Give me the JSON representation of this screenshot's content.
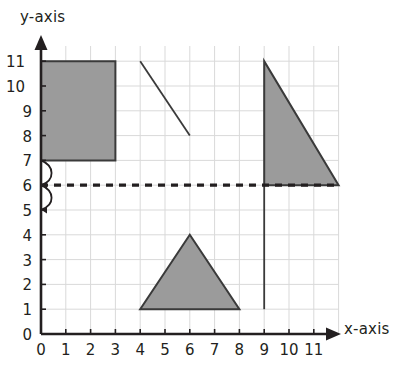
{
  "figure": {
    "kind": "coordinate-grid-diagram",
    "background_color": "#ffffff",
    "grid_color": "#d9d9d9",
    "axis_color": "#231f20",
    "shape_fill_color": "#9b9b9b",
    "shape_stroke_color": "#3a3a3a",
    "dashed_line_color": "#231f20"
  },
  "axes": {
    "x_title": "x-axis",
    "y_title": "y-axis",
    "x_ticks": [
      "0",
      "1",
      "2",
      "3",
      "4",
      "5",
      "6",
      "7",
      "8",
      "9",
      "10",
      "11"
    ],
    "y_ticks": [
      "0",
      "1",
      "2",
      "3",
      "4",
      "5",
      "6",
      "7",
      "8",
      "9",
      "10",
      "11"
    ],
    "x_range": [
      0,
      12
    ],
    "y_range": [
      0,
      11.6
    ],
    "origin_px": [
      41,
      334
    ],
    "unit_px": 24.8
  },
  "chart_data": {
    "type": "scatter",
    "title": "",
    "xlabel": "x-axis",
    "ylabel": "y-axis",
    "xlim": [
      0,
      12
    ],
    "ylim": [
      0,
      11.6
    ],
    "grid": true,
    "legend": "none",
    "shapes": [
      {
        "name": "rectangle",
        "type": "polygon",
        "filled": true,
        "points": [
          [
            0,
            7
          ],
          [
            3,
            7
          ],
          [
            3,
            11
          ],
          [
            0,
            11
          ]
        ]
      },
      {
        "name": "diagonal-segment",
        "type": "line",
        "filled": false,
        "points": [
          [
            4,
            11
          ],
          [
            6,
            8
          ]
        ]
      },
      {
        "name": "right-triangle",
        "type": "polygon",
        "filled": true,
        "points": [
          [
            9,
            11
          ],
          [
            9,
            6
          ],
          [
            12,
            6
          ]
        ]
      },
      {
        "name": "isosceles-triangle",
        "type": "polygon",
        "filled": true,
        "points": [
          [
            4,
            1
          ],
          [
            8,
            1
          ],
          [
            6,
            4
          ]
        ]
      },
      {
        "name": "dashed-horizontal-line",
        "type": "dashed-line",
        "filled": false,
        "points": [
          [
            0,
            6
          ],
          [
            12,
            6
          ]
        ]
      },
      {
        "name": "vertical-line",
        "type": "line",
        "filled": false,
        "points": [
          [
            9,
            1
          ],
          [
            9,
            6
          ]
        ]
      },
      {
        "name": "arc-marker-upper",
        "type": "arc",
        "filled": false,
        "points": [
          [
            0,
            7
          ],
          [
            0,
            6
          ]
        ]
      },
      {
        "name": "arc-marker-lower",
        "type": "arc",
        "filled": false,
        "points": [
          [
            0,
            6
          ],
          [
            0,
            5
          ]
        ]
      }
    ]
  }
}
